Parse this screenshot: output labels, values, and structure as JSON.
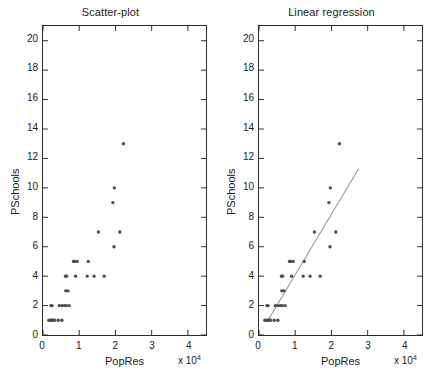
{
  "figure": {
    "background_color": "#ffffff",
    "axis_color": "#2b2b2b",
    "marker_color": "#4d4d4d",
    "line_color": "#999999"
  },
  "panels": [
    {
      "id": "scatter",
      "title": "Scatter-plot",
      "xlabel": "PopRes",
      "ylabel": "PSchools",
      "exponent_label": "x 10",
      "exponent_sup": "4",
      "xticks": [
        "0",
        "1",
        "2",
        "3",
        "4"
      ],
      "yticks": [
        "0",
        "2",
        "4",
        "6",
        "8",
        "10",
        "12",
        "14",
        "16",
        "18",
        "20"
      ],
      "has_regression_line": false
    },
    {
      "id": "regression",
      "title": "Linear regression",
      "xlabel": "PopRes",
      "ylabel": "PSchools",
      "exponent_label": "x 10",
      "exponent_sup": "4",
      "xticks": [
        "0",
        "1",
        "2",
        "3",
        "4"
      ],
      "yticks": [
        "0",
        "2",
        "4",
        "6",
        "8",
        "10",
        "12",
        "14",
        "16",
        "18",
        "20"
      ],
      "has_regression_line": true
    }
  ],
  "chart_data": {
    "type": "scatter",
    "xlabel": "PopRes",
    "ylabel": "PSchools",
    "x_multiplier": 10000,
    "x_multiplier_label": "x 10^4",
    "xlim": [
      0,
      45000
    ],
    "ylim": [
      0,
      21
    ],
    "xticks": [
      0,
      10000,
      20000,
      30000,
      40000
    ],
    "xtick_labels": [
      "0",
      "1",
      "2",
      "3",
      "4"
    ],
    "yticks": [
      0,
      2,
      4,
      6,
      8,
      10,
      12,
      14,
      16,
      18,
      20
    ],
    "ytick_labels": [
      "0",
      "2",
      "4",
      "6",
      "8",
      "10",
      "12",
      "14",
      "16",
      "18",
      "20"
    ],
    "grid": false,
    "legend": null,
    "points": [
      {
        "x": 1600,
        "y": 1
      },
      {
        "x": 2000,
        "y": 1
      },
      {
        "x": 2300,
        "y": 1
      },
      {
        "x": 2600,
        "y": 1
      },
      {
        "x": 2900,
        "y": 1
      },
      {
        "x": 3200,
        "y": 1
      },
      {
        "x": 4200,
        "y": 1
      },
      {
        "x": 5200,
        "y": 1
      },
      {
        "x": 2200,
        "y": 2
      },
      {
        "x": 2500,
        "y": 2
      },
      {
        "x": 4500,
        "y": 2
      },
      {
        "x": 5200,
        "y": 2
      },
      {
        "x": 5900,
        "y": 2
      },
      {
        "x": 6400,
        "y": 2
      },
      {
        "x": 7200,
        "y": 2
      },
      {
        "x": 6300,
        "y": 3
      },
      {
        "x": 6900,
        "y": 3
      },
      {
        "x": 6200,
        "y": 4
      },
      {
        "x": 6500,
        "y": 4
      },
      {
        "x": 9000,
        "y": 4
      },
      {
        "x": 12200,
        "y": 4
      },
      {
        "x": 14100,
        "y": 4
      },
      {
        "x": 16900,
        "y": 4
      },
      {
        "x": 8400,
        "y": 5
      },
      {
        "x": 8800,
        "y": 5
      },
      {
        "x": 9400,
        "y": 5
      },
      {
        "x": 12500,
        "y": 5
      },
      {
        "x": 19600,
        "y": 6
      },
      {
        "x": 15300,
        "y": 7
      },
      {
        "x": 21200,
        "y": 7
      },
      {
        "x": 19300,
        "y": 9
      },
      {
        "x": 19700,
        "y": 10
      },
      {
        "x": 22200,
        "y": 13
      }
    ],
    "regression_line": {
      "x_start": 2500,
      "y_start": 1.0,
      "x_end": 27500,
      "y_end": 11.3,
      "slope_per_unit_x": 0.000412,
      "intercept": -0.03,
      "color": "#999999"
    }
  }
}
